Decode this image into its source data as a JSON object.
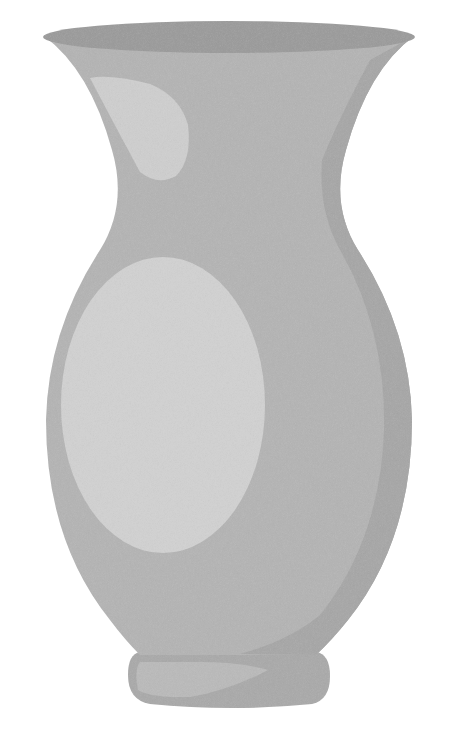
{
  "image": {
    "subject": "vase",
    "width": 464,
    "height": 734,
    "background": "#ffffff"
  },
  "colors": {
    "rim_top": "#9a9a9a",
    "body_base": "#b4b4b4",
    "body_shade": "#a6a6a6",
    "highlight": "#d2d2d2",
    "foot_base": "#a9a9a9",
    "foot_highlight": "#bababa",
    "neck_shadow": "#a3a3a3"
  }
}
